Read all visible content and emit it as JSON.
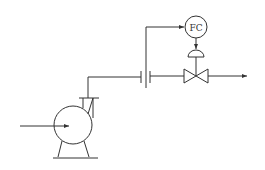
{
  "diagram": {
    "title": "",
    "controller": {
      "label": "FC",
      "type": "flow-controller"
    },
    "components": [
      {
        "id": "pump",
        "type": "centrifugal-pump"
      },
      {
        "id": "orifice",
        "type": "orifice-plate-flow-element"
      },
      {
        "id": "control-valve",
        "type": "pneumatic-control-valve"
      },
      {
        "id": "fc",
        "type": "flow-controller",
        "label": "FC"
      }
    ],
    "connections": [
      {
        "from": "suction-inlet",
        "to": "pump",
        "kind": "process"
      },
      {
        "from": "pump",
        "to": "orifice",
        "kind": "process"
      },
      {
        "from": "orifice",
        "to": "fc",
        "kind": "signal"
      },
      {
        "from": "fc",
        "to": "control-valve",
        "kind": "signal"
      },
      {
        "from": "orifice",
        "to": "control-valve",
        "kind": "process"
      },
      {
        "from": "control-valve",
        "to": "outlet",
        "kind": "process"
      }
    ],
    "colors": {
      "line": "#333333",
      "background": "#ffffff"
    }
  }
}
